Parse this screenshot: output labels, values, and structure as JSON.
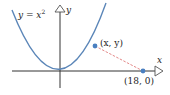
{
  "diagram": {
    "type": "parabola-distance",
    "curve_label": "y = x²",
    "curve_label_parts": {
      "lhs": "y",
      "eq": " = ",
      "base": "x",
      "exp": "2"
    },
    "axes": {
      "x_label": "x",
      "y_label": "y"
    },
    "point_on_curve": {
      "label": "(x, y)",
      "label_x": "x",
      "label_y": "y"
    },
    "fixed_point": {
      "label": "(18, 0)"
    },
    "colors": {
      "curve": "#5b86b8",
      "points": "#4a7fc0",
      "dashed_segment": "#e07a7a",
      "axes": "#333333",
      "text": "#222222"
    }
  }
}
